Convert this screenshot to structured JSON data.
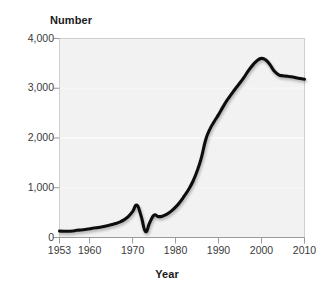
{
  "figure": {
    "y_axis_title": "Number",
    "x_axis_title": "Year",
    "plot_background": "#f2f2f2",
    "plot_border_color": "#cccccc",
    "line_color": "#111111",
    "gridline_color": "#ffffff",
    "tick_color": "#9a9a9a",
    "label_color": "#3a3a3a"
  },
  "chart_data": {
    "type": "line",
    "title": "",
    "subtitle": "",
    "xlabel": "Year",
    "ylabel": "Number",
    "xlim": [
      1953,
      2010
    ],
    "ylim": [
      0,
      4000
    ],
    "grid": true,
    "legend": null,
    "legend_position": "none",
    "y_ticks": [
      0,
      1000,
      2000,
      3000,
      4000
    ],
    "y_tick_labels": [
      "0",
      "1,000",
      "2,000",
      "3,000",
      "4,000"
    ],
    "x_ticks": [
      1953,
      1960,
      1970,
      1980,
      1990,
      2000,
      2010
    ],
    "x_tick_labels": [
      "1953",
      "1960",
      "1970",
      "1980",
      "1990",
      "2000",
      "2010"
    ],
    "annotations": [],
    "series": [
      {
        "name": "Number",
        "color": "#111111",
        "x": [
          1953,
          1954,
          1955,
          1956,
          1957,
          1958,
          1959,
          1960,
          1961,
          1962,
          1963,
          1964,
          1965,
          1966,
          1967,
          1968,
          1969,
          1970,
          1971,
          1972,
          1973,
          1974,
          1975,
          1976,
          1977,
          1978,
          1979,
          1980,
          1981,
          1982,
          1983,
          1984,
          1985,
          1986,
          1987,
          1988,
          1989,
          1990,
          1991,
          1992,
          1993,
          1994,
          1995,
          1996,
          1997,
          1998,
          1999,
          2000,
          2001,
          2002,
          2003,
          2004,
          2005,
          2006,
          2007,
          2008,
          2009,
          2010
        ],
        "values": [
          130,
          125,
          125,
          130,
          145,
          150,
          160,
          175,
          190,
          200,
          215,
          235,
          255,
          280,
          310,
          355,
          420,
          520,
          650,
          430,
          120,
          300,
          450,
          420,
          430,
          470,
          530,
          610,
          710,
          830,
          960,
          1120,
          1330,
          1600,
          1960,
          2180,
          2330,
          2470,
          2620,
          2760,
          2880,
          3000,
          3110,
          3230,
          3360,
          3470,
          3560,
          3600,
          3570,
          3470,
          3340,
          3270,
          3250,
          3240,
          3230,
          3210,
          3195,
          3180
        ]
      }
    ]
  }
}
